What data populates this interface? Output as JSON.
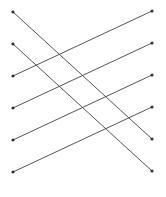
{
  "diagram": {
    "type": "bipartite-matching",
    "width": 166,
    "height": 197,
    "colors": {
      "line": "#555555",
      "node": "#333333",
      "background": "#ffffff"
    },
    "left_nodes": [
      {
        "id": "L0",
        "x": 13,
        "y": 12
      },
      {
        "id": "L1",
        "x": 13,
        "y": 44
      },
      {
        "id": "L2",
        "x": 13,
        "y": 76
      },
      {
        "id": "L3",
        "x": 13,
        "y": 108
      },
      {
        "id": "L4",
        "x": 13,
        "y": 140
      },
      {
        "id": "L5",
        "x": 13,
        "y": 172
      }
    ],
    "right_nodes": [
      {
        "id": "R0",
        "x": 152,
        "y": 11
      },
      {
        "id": "R1",
        "x": 152,
        "y": 43
      },
      {
        "id": "R2",
        "x": 152,
        "y": 75
      },
      {
        "id": "R3",
        "x": 152,
        "y": 107
      },
      {
        "id": "R4",
        "x": 152,
        "y": 139
      },
      {
        "id": "R5",
        "x": 152,
        "y": 171
      }
    ],
    "edges": [
      {
        "from": "L0",
        "to": "R4"
      },
      {
        "from": "L1",
        "to": "R5"
      },
      {
        "from": "L2",
        "to": "R0"
      },
      {
        "from": "L3",
        "to": "R1"
      },
      {
        "from": "L4",
        "to": "R2"
      },
      {
        "from": "L5",
        "to": "R3"
      }
    ]
  }
}
